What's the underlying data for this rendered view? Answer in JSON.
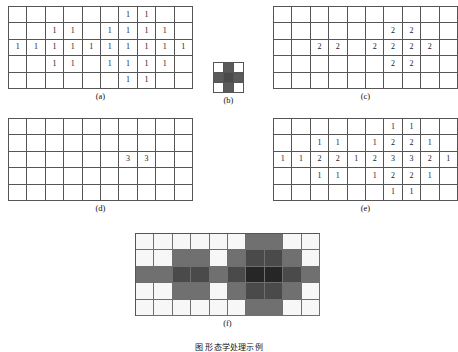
{
  "figure": {
    "bottom_caption": "图      形态学处理示例",
    "panels": [
      {
        "id": "a",
        "label": "(a)"
      },
      {
        "id": "b",
        "label": "(b)"
      },
      {
        "id": "c",
        "label": "(c)"
      },
      {
        "id": "d",
        "label": "(d)"
      },
      {
        "id": "e",
        "label": "(e)"
      },
      {
        "id": "f",
        "label": "(f)"
      }
    ]
  },
  "chart_data": {
    "type": "heatmap",
    "xlabel": "",
    "ylabel": "",
    "grid": true,
    "legend": "none",
    "panels": [
      {
        "id": "a",
        "label": "(a)",
        "type": "table",
        "rows": 5,
        "cols": 10,
        "values": [
          [
            "",
            "",
            "",
            "",
            "",
            "",
            "1",
            "1",
            "",
            ""
          ],
          [
            "",
            "",
            "1",
            "1",
            "",
            "1",
            "1",
            "1",
            "1",
            ""
          ],
          [
            "1",
            "1",
            "1",
            "1",
            "1",
            "1",
            "1",
            "1",
            "1",
            "1"
          ],
          [
            "",
            "",
            "1",
            "1",
            "",
            "1",
            "1",
            "1",
            "1",
            ""
          ],
          [
            "",
            "",
            "",
            "",
            "",
            "",
            "1",
            "1",
            "",
            ""
          ]
        ]
      },
      {
        "id": "b",
        "label": "(b)",
        "type": "heatmap",
        "rows": 3,
        "cols": 3,
        "note": "structuring element",
        "shades": [
          [
            "#ffffff",
            "#5a5a5a",
            "#ffffff"
          ],
          [
            "#5a5a5a",
            "#4a4a4a",
            "#5a5a5a"
          ],
          [
            "#ffffff",
            "#5a5a5a",
            "#ffffff"
          ]
        ]
      },
      {
        "id": "c",
        "label": "(c)",
        "type": "table",
        "rows": 5,
        "cols": 10,
        "values": [
          [
            "",
            "",
            "",
            "",
            "",
            "",
            "",
            "",
            "",
            ""
          ],
          [
            "",
            "",
            "",
            "",
            "",
            "",
            "2",
            "2",
            "",
            ""
          ],
          [
            "",
            "",
            "2",
            "2",
            "",
            "2",
            "2",
            "2",
            "2",
            ""
          ],
          [
            "",
            "",
            "",
            "",
            "",
            "",
            "2",
            "2",
            "",
            ""
          ],
          [
            "",
            "",
            "",
            "",
            "",
            "",
            "",
            "",
            "",
            ""
          ]
        ]
      },
      {
        "id": "d",
        "label": "(d)",
        "type": "table",
        "rows": 5,
        "cols": 10,
        "values": [
          [
            "",
            "",
            "",
            "",
            "",
            "",
            "",
            "",
            "",
            ""
          ],
          [
            "",
            "",
            "",
            "",
            "",
            "",
            "",
            "",
            "",
            ""
          ],
          [
            "",
            "",
            "",
            "",
            "",
            "",
            "3",
            "3",
            "",
            ""
          ],
          [
            "",
            "",
            "",
            "",
            "",
            "",
            "",
            "",
            "",
            ""
          ],
          [
            "",
            "",
            "",
            "",
            "",
            "",
            "",
            "",
            "",
            ""
          ]
        ]
      },
      {
        "id": "e",
        "label": "(e)",
        "type": "table",
        "rows": 5,
        "cols": 10,
        "values": [
          [
            "",
            "",
            "",
            "",
            "",
            "",
            "1",
            "1",
            "",
            ""
          ],
          [
            "",
            "",
            "1",
            "1",
            "",
            "1",
            "2",
            "2",
            "1",
            ""
          ],
          [
            "1",
            "1",
            "2",
            "2",
            "1",
            "2",
            "3",
            "3",
            "2",
            "1"
          ],
          [
            "",
            "",
            "1",
            "1",
            "",
            "1",
            "2",
            "2",
            "1",
            ""
          ],
          [
            "",
            "",
            "",
            "",
            "",
            "",
            "1",
            "1",
            "",
            ""
          ]
        ]
      },
      {
        "id": "f",
        "label": "(f)",
        "type": "heatmap",
        "rows": 5,
        "cols": 10,
        "note": "grayscale rendering of (e); value 0=white, 1=medium gray, 2=dark gray, 3=near black",
        "values": [
          [
            0,
            0,
            0,
            0,
            0,
            0,
            1,
            1,
            0,
            0
          ],
          [
            0,
            0,
            1,
            1,
            0,
            1,
            2,
            2,
            1,
            0
          ],
          [
            1,
            1,
            2,
            2,
            1,
            2,
            3,
            3,
            2,
            1
          ],
          [
            0,
            0,
            1,
            1,
            0,
            1,
            2,
            2,
            1,
            0
          ],
          [
            0,
            0,
            0,
            0,
            0,
            0,
            1,
            1,
            0,
            0
          ]
        ],
        "shade_map": [
          "#f7f7f7",
          "#707070",
          "#4a4a4a",
          "#262626"
        ]
      }
    ]
  }
}
